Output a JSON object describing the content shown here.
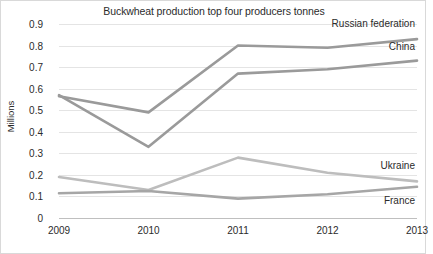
{
  "chart_data": {
    "type": "line",
    "title": "Buckwheat production top four producers tonnes",
    "xlabel": "",
    "ylabel": "Millions",
    "categories": [
      "2009",
      "2010",
      "2011",
      "2012",
      "2013"
    ],
    "x": [
      2009,
      2010,
      2011,
      2012,
      2013
    ],
    "ylim": [
      0,
      0.9
    ],
    "yticks": [
      "0",
      "0.1",
      "0.2",
      "0.3",
      "0.4",
      "0.5",
      "0.6",
      "0.7",
      "0.8",
      "0.9"
    ],
    "ytick_values": [
      0,
      0.1,
      0.2,
      0.3,
      0.4,
      0.5,
      0.6,
      0.7,
      0.8,
      0.9
    ],
    "grid": true,
    "legend_position": "inline-right-of-line-ends",
    "series": [
      {
        "name": "Russian federation",
        "color": "#9a9a9a",
        "values": [
          0.565,
          0.49,
          0.8,
          0.79,
          0.83
        ]
      },
      {
        "name": "China",
        "color": "#9a9a9a",
        "values": [
          0.57,
          0.33,
          0.67,
          0.69,
          0.73
        ]
      },
      {
        "name": "Ukraine",
        "color": "#bdbdbd",
        "values": [
          0.19,
          0.13,
          0.28,
          0.21,
          0.17
        ]
      },
      {
        "name": "France",
        "color": "#a6a6a6",
        "values": [
          0.115,
          0.125,
          0.09,
          0.11,
          0.145
        ]
      }
    ]
  }
}
